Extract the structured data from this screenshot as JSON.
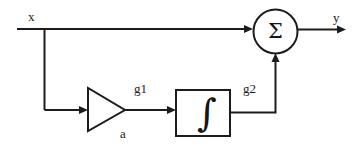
{
  "diagram": {
    "type": "block-diagram",
    "stroke_color": "#1c1c1c",
    "background_color": "#ffffff",
    "signals": {
      "input_label": "x",
      "output_label": "y",
      "gain_output_label": "g1",
      "integrator_output_label": "g2",
      "gain_value_label": "a"
    },
    "blocks": {
      "summer_symbol": "Σ",
      "integrator_symbol": "∫",
      "gain_symbol": "a"
    }
  }
}
